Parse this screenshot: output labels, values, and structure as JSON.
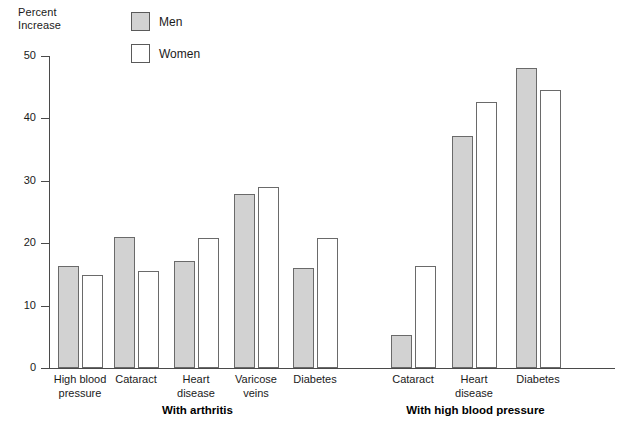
{
  "axis_title": "Percent\nIncrease",
  "legend": {
    "items": [
      {
        "label": "Men",
        "swatch": "men-swatch",
        "color": "#d2d2d2"
      },
      {
        "label": "Women",
        "swatch": "women-swatch",
        "color": "#ffffff"
      }
    ]
  },
  "chart_data": {
    "type": "bar",
    "title": "",
    "subtitle": "",
    "xlabel": "",
    "ylabel": "Percent Increase",
    "ylim": [
      0,
      50
    ],
    "yticks": [
      0,
      10,
      20,
      30,
      40,
      50
    ],
    "ytick_labels": [
      "0",
      "10",
      "20",
      "30",
      "40",
      "50"
    ],
    "grid": false,
    "legend_position": "top-center",
    "categories": [
      "High blood pressure",
      "Cataract",
      "Heart disease",
      "Varicose veins",
      "Diabetes",
      "Cataract",
      "Heart disease",
      "Diabetes"
    ],
    "category_labels": [
      "High blood\npressure",
      "Cataract",
      "Heart\ndisease",
      "Varicose\nveins",
      "Diabetes",
      "Cataract",
      "Heart\ndisease",
      "Diabetes"
    ],
    "series": [
      {
        "name": "Men",
        "color": "#d2d2d2",
        "values": [
          16.3,
          21,
          17.1,
          27.9,
          16,
          5.3,
          37.2,
          48
        ]
      },
      {
        "name": "Women",
        "color": "#ffffff",
        "values": [
          14.9,
          15.6,
          20.9,
          29,
          20.9,
          16.4,
          42.7,
          44.5
        ]
      }
    ],
    "groups": [
      {
        "label": "With arthritis",
        "categories": [
          0,
          1,
          2,
          3,
          4
        ]
      },
      {
        "label": "With high blood pressure",
        "categories": [
          5,
          6,
          7
        ]
      }
    ]
  }
}
